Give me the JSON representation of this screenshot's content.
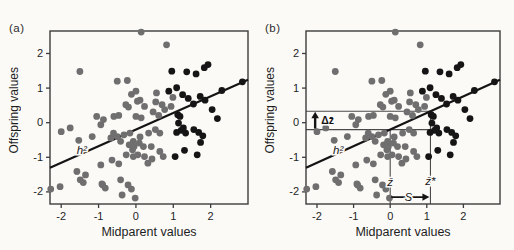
{
  "figure": {
    "panel_tags": [
      "(a)",
      "(b)"
    ],
    "background": "#fbfaf7"
  },
  "chart_data": {
    "type": "scatter",
    "title": "",
    "xlabel": "Midparent values",
    "ylabel": "Offspring values",
    "xlim": [
      -2.3,
      3.0
    ],
    "ylim": [
      -2.35,
      2.65
    ],
    "x_ticks": [
      -2,
      -1,
      0,
      1,
      2
    ],
    "y_ticks": [
      2,
      1,
      0,
      -1,
      -2
    ],
    "grid": false,
    "legend": "none",
    "colors": {
      "spine": "#3c3c3c",
      "ink": "#141414",
      "annotation_line": "#4a4a4a",
      "tick_text": "#1f1f1f",
      "halo": "#fbfaf7"
    },
    "regression_line": {
      "slope": 0.48,
      "intercept": -0.2,
      "label": "h²",
      "color": "#141414"
    },
    "series": [
      {
        "name": "unselected parents",
        "color": "#6f6f6f",
        "points": [
          [
            0.14,
            2.62
          ],
          [
            0.82,
            2.25
          ],
          [
            -1.5,
            1.48
          ],
          [
            -0.5,
            1.2
          ],
          [
            -0.23,
            1.22
          ],
          [
            -0.12,
            0.82
          ],
          [
            0.11,
            0.65
          ],
          [
            0.0,
            0.91
          ],
          [
            -0.2,
            0.45
          ],
          [
            0.04,
            0.62
          ],
          [
            -0.27,
            0.52
          ],
          [
            0.23,
            0.47
          ],
          [
            -0.59,
            0.18
          ],
          [
            -0.46,
            0.21
          ],
          [
            -0.87,
            0.09
          ],
          [
            -1.05,
            0.18
          ],
          [
            0.0,
            0.18
          ],
          [
            0.14,
            0.14
          ],
          [
            0.55,
            0.86
          ],
          [
            0.53,
            0.6
          ],
          [
            0.7,
            0.52
          ],
          [
            0.99,
            0.73
          ],
          [
            0.94,
            0.47
          ],
          [
            0.61,
            0.21
          ],
          [
            0.46,
            0.31
          ],
          [
            0.77,
            0.38
          ],
          [
            -1.76,
            -0.15
          ],
          [
            -2.0,
            -0.26
          ],
          [
            -1.53,
            -0.51
          ],
          [
            -1.17,
            -0.4
          ],
          [
            -0.94,
            -0.06
          ],
          [
            -0.67,
            -0.44
          ],
          [
            -0.6,
            -0.3
          ],
          [
            -0.41,
            -0.54
          ],
          [
            -0.16,
            -0.3
          ],
          [
            -0.07,
            -0.54
          ],
          [
            0.11,
            -0.41
          ],
          [
            0.34,
            -0.3
          ],
          [
            0.2,
            -0.69
          ],
          [
            -0.09,
            -0.78
          ],
          [
            -0.26,
            -0.93
          ],
          [
            -0.07,
            -0.98
          ],
          [
            0.05,
            -0.93
          ],
          [
            -0.32,
            -0.35
          ],
          [
            -0.5,
            -0.4
          ],
          [
            -0.18,
            -0.64
          ],
          [
            -0.05,
            -0.69
          ],
          [
            0.09,
            -0.59
          ],
          [
            0.41,
            -0.69
          ],
          [
            0.64,
            -0.83
          ],
          [
            0.73,
            -0.98
          ],
          [
            0.23,
            -0.98
          ],
          [
            0.52,
            -0.2
          ],
          [
            0.64,
            -0.3
          ],
          [
            -0.94,
            -1.22
          ],
          [
            -1.58,
            -1.41
          ],
          [
            -1.49,
            -1.65
          ],
          [
            -1.35,
            -1.51
          ],
          [
            -2.03,
            -1.85
          ],
          [
            -2.28,
            -1.92
          ],
          [
            -0.89,
            -1.8
          ],
          [
            -0.41,
            -1.65
          ],
          [
            -0.21,
            -1.8
          ],
          [
            -0.37,
            -2.09
          ],
          [
            -0.46,
            -1.19
          ],
          [
            0.32,
            -1.17
          ],
          [
            0.43,
            -1.05
          ],
          [
            -0.64,
            -1.08
          ],
          [
            -1.41,
            -1.73
          ],
          [
            -0.91,
            -1.77
          ],
          [
            -0.82,
            -1.89
          ],
          [
            -0.12,
            -1.92
          ],
          [
            -0.02,
            -2.18
          ]
        ]
      },
      {
        "name": "selected parents",
        "color": "#151515",
        "points": [
          [
            0.96,
            1.49
          ],
          [
            1.36,
            1.47
          ],
          [
            1.61,
            1.41
          ],
          [
            1.83,
            1.59
          ],
          [
            1.93,
            1.68
          ],
          [
            2.85,
            1.18
          ],
          [
            0.88,
            0.91
          ],
          [
            1.09,
            1.01
          ],
          [
            1.25,
            0.81
          ],
          [
            1.4,
            0.7
          ],
          [
            1.72,
            0.76
          ],
          [
            1.85,
            0.65
          ],
          [
            2.3,
            0.93
          ],
          [
            1.54,
            0.54
          ],
          [
            2.04,
            0.38
          ],
          [
            2.18,
            0.12
          ],
          [
            1.12,
            0.23
          ],
          [
            1.18,
            0.18
          ],
          [
            1.27,
            -0.15
          ],
          [
            1.14,
            -0.01
          ],
          [
            1.21,
            -0.22
          ],
          [
            1.09,
            -0.28
          ],
          [
            1.33,
            -0.3
          ],
          [
            1.55,
            -0.2
          ],
          [
            1.68,
            -0.28
          ],
          [
            1.79,
            -0.38
          ],
          [
            1.73,
            -0.57
          ],
          [
            1.05,
            -0.98
          ],
          [
            1.64,
            -0.93
          ],
          [
            1.3,
            -0.8
          ]
        ]
      }
    ],
    "panels": [
      {
        "tag": "(a)",
        "h2_label_pos": [
          -1.45,
          -0.8
        ]
      },
      {
        "tag": "(b)",
        "h2_label_pos": [
          -1.42,
          -0.78
        ],
        "annotations": {
          "selected_mean_hline": {
            "y": 0.33,
            "x_to": 1.1
          },
          "population_mean_hline": {
            "y": -0.2,
            "x_to": 1.1
          },
          "response_arrow": {
            "label": "Δz̄",
            "x": -2.05,
            "y_from": -0.2,
            "y_to": 0.33
          },
          "midparent_mean_vline": {
            "label": "z̄",
            "x": 0,
            "y_from": -0.2,
            "label_y": -1.72
          },
          "selected_mean_vline": {
            "label": "z̄*",
            "x": 1.1,
            "y_from": 0.33,
            "label_y": -1.68
          },
          "selection_differential_arrow": {
            "label": "S",
            "y": -2.15,
            "x_from": 0,
            "x_to": 1.1,
            "label_x": 0.5
          }
        }
      }
    ]
  }
}
